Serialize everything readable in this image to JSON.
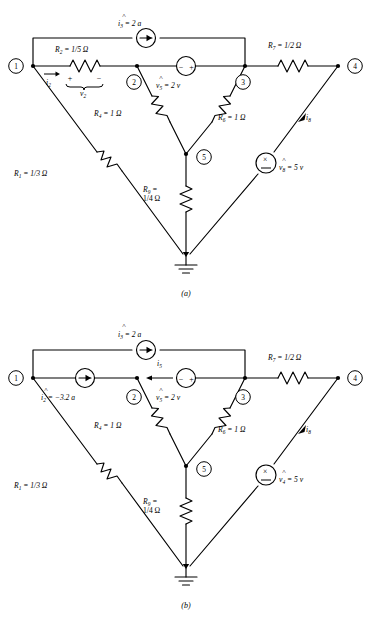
{
  "figure": {
    "title_caption_a": "(a)",
    "title_caption_b": "(b)",
    "domain": "circuit-schematic"
  },
  "panel_a": {
    "caption": "(a)",
    "nodes": [
      {
        "id": "1",
        "label": "1"
      },
      {
        "id": "2",
        "label": "2"
      },
      {
        "id": "3",
        "label": "3"
      },
      {
        "id": "4",
        "label": "4"
      },
      {
        "id": "5",
        "label": "5"
      }
    ],
    "elements": [
      {
        "name": "current-source-i3",
        "label": "i",
        "sub": "3",
        "value": "= 2 a",
        "hat": "˄",
        "type": "current-source"
      },
      {
        "name": "resistor-r2",
        "label": "R",
        "sub": "2",
        "value": "= 1/5 Ω",
        "type": "resistor"
      },
      {
        "name": "voltage-source-v5",
        "label": "v",
        "sub": "5",
        "value": "= 2 v",
        "hat": "˄",
        "type": "voltage-source",
        "polarity_left": "−",
        "polarity_right": "+"
      },
      {
        "name": "resistor-r7",
        "label": "R",
        "sub": "7",
        "value": "= 1/2 Ω",
        "type": "resistor"
      },
      {
        "name": "resistor-r4",
        "label": "R",
        "sub": "4",
        "value": "= 1 Ω",
        "type": "resistor"
      },
      {
        "name": "resistor-r6",
        "label": "R",
        "sub": "6",
        "value": "= 1 Ω",
        "type": "resistor"
      },
      {
        "name": "resistor-r1",
        "label": "R",
        "sub": "1",
        "value": "= 1/3 Ω",
        "type": "resistor"
      },
      {
        "name": "resistor-r9",
        "label": "R",
        "sub": "9",
        "value": "=",
        "value2": "1/4 Ω",
        "type": "resistor"
      },
      {
        "name": "voltage-source-v8",
        "label": "v",
        "sub": "8",
        "value": "= 5 v",
        "hat": "˄",
        "type": "voltage-source-x",
        "marker": "×"
      }
    ],
    "currents": [
      {
        "name": "current-label-i2",
        "label": "i",
        "sub": "2"
      },
      {
        "name": "current-label-i8",
        "label": "i",
        "sub": "8"
      }
    ],
    "voltage_brace": {
      "name": "voltage-label-v2",
      "label": "v",
      "sub": "2",
      "plus": "+",
      "minus": "−"
    },
    "ground": {
      "name": "ground-symbol",
      "label": "ground"
    }
  },
  "panel_b": {
    "caption": "(b)",
    "nodes": [
      {
        "id": "1",
        "label": "1"
      },
      {
        "id": "2",
        "label": "2"
      },
      {
        "id": "3",
        "label": "3"
      },
      {
        "id": "4",
        "label": "4"
      },
      {
        "id": "5",
        "label": "5"
      }
    ],
    "elements": [
      {
        "name": "current-source-i3",
        "label": "i",
        "sub": "3",
        "value": "= 2 a",
        "hat": "˄",
        "type": "current-source"
      },
      {
        "name": "current-source-i2",
        "label": "i",
        "sub": "2",
        "value": "= −3.2 a",
        "hat": "˄",
        "type": "current-source"
      },
      {
        "name": "voltage-source-v5",
        "label": "v",
        "sub": "5",
        "value": "= 2 v",
        "hat": "˄",
        "type": "voltage-source",
        "polarity_left": "−",
        "polarity_right": "+"
      },
      {
        "name": "resistor-r7",
        "label": "R",
        "sub": "7",
        "value": "= 1/2 Ω",
        "type": "resistor"
      },
      {
        "name": "resistor-r4",
        "label": "R",
        "sub": "4",
        "value": "= 1 Ω",
        "type": "resistor"
      },
      {
        "name": "resistor-r6",
        "label": "R",
        "sub": "6",
        "value": "= 1 Ω",
        "type": "resistor"
      },
      {
        "name": "resistor-r1",
        "label": "R",
        "sub": "1",
        "value": "= 1/3 Ω",
        "type": "resistor"
      },
      {
        "name": "resistor-r9",
        "label": "R",
        "sub": "9",
        "value": "=",
        "value2": "1/4 Ω",
        "type": "resistor"
      },
      {
        "name": "voltage-source-v4",
        "label": "v",
        "sub": "4",
        "value": "= 5 v",
        "hat": "˄",
        "type": "voltage-source-x",
        "marker": "×"
      }
    ],
    "currents": [
      {
        "name": "current-label-i5",
        "label": "i",
        "sub": "5"
      },
      {
        "name": "current-label-i8",
        "label": "i",
        "sub": "8"
      }
    ],
    "ground": {
      "name": "ground-symbol",
      "label": "ground"
    }
  },
  "colors": {
    "ink": "#000000",
    "paper": "#ffffff"
  }
}
